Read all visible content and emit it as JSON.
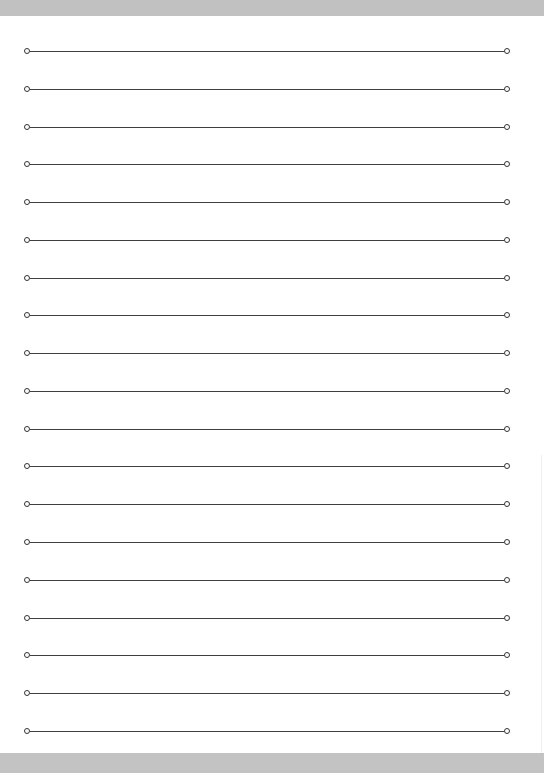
{
  "document": {
    "type": "lined-paper",
    "line_count": 19,
    "line_positions_y": [
      51,
      89,
      127,
      164,
      202,
      240,
      278,
      315,
      353,
      391,
      429,
      466,
      504,
      542,
      580,
      618,
      655,
      693,
      731
    ],
    "line_left_x": 27,
    "line_right_x": 506,
    "endpoint_marker": "hollow-circle",
    "colors": {
      "line": "#3f3f3f",
      "background": "#ffffff",
      "border_band": "#c1c1c1"
    }
  }
}
